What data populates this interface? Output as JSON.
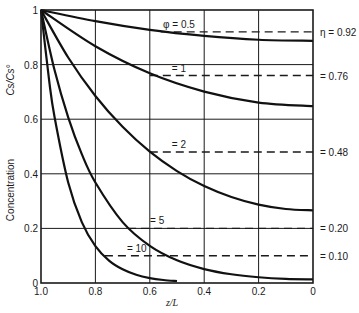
{
  "chart_data": {
    "type": "line",
    "title": "",
    "xlabel": "z/L",
    "ylabel": "Concentration",
    "ylabel_symbol": "Cs/Cs°",
    "xlim": [
      1.0,
      0
    ],
    "ylim": [
      0,
      1
    ],
    "x_ticks": [
      "1.0",
      "0.8",
      "0.6",
      "0.4",
      "0.2",
      "0"
    ],
    "y_ticks": [
      "0",
      "0.2",
      "0.4",
      "0.6",
      "0.8",
      "1"
    ],
    "grid": true,
    "series": [
      {
        "name": "φ = 0.5",
        "label": "φ = 0.5",
        "x": [
          1.0,
          0.8,
          0.6,
          0.4,
          0.2,
          0.0
        ],
        "values": [
          1.0,
          0.959,
          0.927,
          0.905,
          0.891,
          0.887
        ]
      },
      {
        "name": "φ = 1",
        "label": "= 1",
        "x": [
          1.0,
          0.8,
          0.6,
          0.4,
          0.2,
          0.0
        ],
        "values": [
          1.0,
          0.867,
          0.768,
          0.701,
          0.661,
          0.648
        ]
      },
      {
        "name": "φ = 2",
        "label": "= 2",
        "x": [
          1.0,
          0.9,
          0.8,
          0.7,
          0.6,
          0.5,
          0.4,
          0.3,
          0.2,
          0.1,
          0.0
        ],
        "values": [
          1.0,
          0.826,
          0.685,
          0.572,
          0.481,
          0.41,
          0.355,
          0.315,
          0.287,
          0.271,
          0.266
        ]
      },
      {
        "name": "φ = 5",
        "label": "= 5",
        "x": [
          1.0,
          0.95,
          0.9,
          0.85,
          0.8,
          0.7,
          0.6,
          0.5,
          0.4,
          0.3,
          0.2,
          0.1,
          0.0
        ],
        "values": [
          1.0,
          0.779,
          0.607,
          0.472,
          0.368,
          0.223,
          0.136,
          0.083,
          0.051,
          0.032,
          0.021,
          0.015,
          0.013
        ]
      },
      {
        "name": "φ = 10",
        "label": "= 10",
        "x": [
          1.0,
          0.97,
          0.95,
          0.9,
          0.85,
          0.8,
          0.75,
          0.7,
          0.65,
          0.6,
          0.55,
          0.5
        ],
        "values": [
          1.0,
          0.741,
          0.607,
          0.368,
          0.223,
          0.135,
          0.082,
          0.05,
          0.03,
          0.018,
          0.011,
          0.007
        ]
      }
    ],
    "effectiveness_lines": [
      {
        "phi_label": "φ = 0.5",
        "eta": 0.92,
        "label": "η = 0.92",
        "x_start": 0.56
      },
      {
        "phi_label": "= 1",
        "eta": 0.76,
        "label": "= 0.76",
        "x_start": 0.6
      },
      {
        "phi_label": "= 2",
        "eta": 0.48,
        "label": "= 0.48",
        "x_start": 0.6
      },
      {
        "phi_label": "= 5",
        "eta": 0.2,
        "label": "= 0.20",
        "x_start": 0.68
      },
      {
        "phi_label": "= 10",
        "eta": 0.1,
        "label": "= 0.10",
        "x_start": 0.765
      }
    ],
    "legend_position": "inline labels on right"
  }
}
